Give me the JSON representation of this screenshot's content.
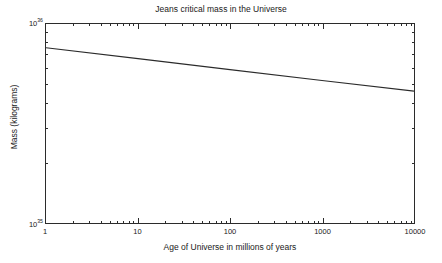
{
  "chart_data": {
    "type": "line",
    "title": "Jeans critical mass in the Universe",
    "xlabel": "Age of Universe in millions of years",
    "ylabel": "Mass (kilograms)",
    "xscale": "log",
    "yscale": "log",
    "xlim": [
      1,
      10000
    ],
    "ylim": [
      1e+35,
      1e+36
    ],
    "grid": false,
    "legend": null,
    "xticks": [
      {
        "value": 1,
        "label": "1"
      },
      {
        "value": 10,
        "label": "10"
      },
      {
        "value": 100,
        "label": "100"
      },
      {
        "value": 1000,
        "label": "1000"
      },
      {
        "value": 10000,
        "label": "10000"
      }
    ],
    "yticks": [
      {
        "value": 1e+35,
        "mantissa": "10",
        "exponent": "35"
      },
      {
        "value": 1e+36,
        "mantissa": "10",
        "exponent": "36"
      }
    ],
    "series": [
      {
        "name": "Jeans critical mass",
        "color": "#2b2b2b",
        "x": [
          1,
          10,
          100,
          1000,
          10000
        ],
        "y": [
          7.6e+35,
          6.7e+35,
          5.9e+35,
          5.2e+35,
          4.6e+35
        ]
      }
    ]
  },
  "figure": {
    "background_color": "#ffffff",
    "axis_color": "#2b2b2b",
    "text_color": "#1a1a1a"
  }
}
